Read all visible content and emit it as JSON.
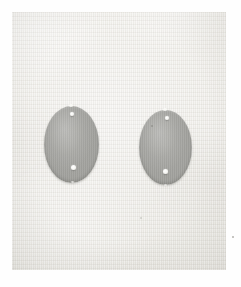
{
  "image": {
    "kind": "photograph",
    "caption": "Two gray oval objects on a light woven cloth background",
    "width_px": 241,
    "height_px": 287,
    "border": {
      "name": "white paper margin",
      "color": "#fefefe",
      "thickness_px": 12
    },
    "background": {
      "name": "woven cloth field",
      "description": "light gray-beige textile with fine vertical thread texture",
      "base_color": "#e9e7e1",
      "highlight_color": "#f4f2ed",
      "shadow_color": "#dcdad3"
    },
    "objects": [
      {
        "id": "oval-left",
        "label": "left oval object",
        "shape": "ellipse",
        "fill_color": "#a0a09c",
        "edge_color": "#84847f",
        "position_px": {
          "x": 44,
          "y": 106
        },
        "size_px": {
          "width": 55,
          "height": 77
        },
        "features": [
          {
            "id": "left-top-hole",
            "label": "upper drilled hole",
            "position_px": {
              "x": 72,
              "y": 114
            },
            "diameter_px": 4,
            "color": "#ffffff"
          },
          {
            "id": "left-bottom-hole",
            "label": "lower drilled hole",
            "position_px": {
              "x": 74,
              "y": 168
            },
            "diameter_px": 5,
            "color": "#ffffff"
          },
          {
            "id": "left-top-nick",
            "label": "top edge highlight",
            "position_px": {
              "x": 71,
              "y": 105
            },
            "diameter_px": 4,
            "color": "#fafaf7"
          }
        ]
      },
      {
        "id": "oval-right",
        "label": "right oval object",
        "shape": "ellipse",
        "fill_color": "#a0a09c",
        "edge_color": "#84847f",
        "position_px": {
          "x": 139,
          "y": 110
        },
        "size_px": {
          "width": 53,
          "height": 75
        },
        "features": [
          {
            "id": "right-top-hole",
            "label": "upper drilled hole",
            "position_px": {
              "x": 167,
              "y": 118
            },
            "diameter_px": 4,
            "color": "#ffffff"
          },
          {
            "id": "right-bottom-hole",
            "label": "lower drilled hole",
            "position_px": {
              "x": 166,
              "y": 172
            },
            "diameter_px": 5,
            "color": "#ffffff"
          },
          {
            "id": "right-top-nick",
            "label": "top edge highlight",
            "position_px": {
              "x": 165,
              "y": 109
            },
            "diameter_px": 4,
            "color": "#fafaf7"
          },
          {
            "id": "right-upper-mark",
            "label": "faint surface mark",
            "position_px": {
              "x": 152,
              "y": 126
            },
            "diameter_px": 2,
            "color": "#8e8e8a"
          }
        ]
      }
    ],
    "blemishes": [
      {
        "id": "speck-lower-right",
        "label": "dark speck on cloth",
        "position_px": {
          "x": 233,
          "y": 237
        },
        "diameter_px": 2
      },
      {
        "id": "speck-lower-center",
        "label": "faint speck on cloth",
        "position_px": {
          "x": 141,
          "y": 218
        },
        "diameter_px": 2
      }
    ]
  }
}
